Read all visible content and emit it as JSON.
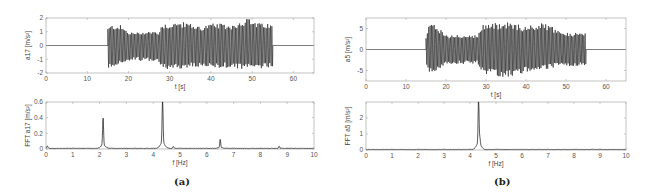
{
  "panels": [
    {
      "label": "(a)"
    },
    {
      "label": "(b)"
    }
  ],
  "chart_data": [
    {
      "type": "line",
      "panel": "(a)",
      "position": "top",
      "xlabel": "t [s]",
      "ylabel": "a17 [m/s²]",
      "xlim": [
        0,
        65
      ],
      "ylim": [
        -2,
        2
      ],
      "xticks": [
        0,
        10,
        20,
        30,
        40,
        50,
        60
      ],
      "yticks": [
        -2,
        -1,
        0,
        1,
        2
      ],
      "active_interval": [
        15,
        55
      ],
      "envelope": {
        "t": [
          15,
          16,
          18,
          20,
          22,
          24,
          26,
          27.5,
          28,
          30,
          32,
          34,
          36,
          38,
          40,
          42,
          44,
          46,
          48,
          49,
          50,
          52,
          54,
          55
        ],
        "upper": [
          1.3,
          1.5,
          1.5,
          1.0,
          0.95,
          1.05,
          1.05,
          1.0,
          1.6,
          1.6,
          1.7,
          1.7,
          1.5,
          1.4,
          1.6,
          1.6,
          1.5,
          1.6,
          1.9,
          2.0,
          1.8,
          1.6,
          1.6,
          1.5
        ],
        "lower": [
          -1.8,
          -1.6,
          -1.3,
          -1.2,
          -1.1,
          -1.15,
          -1.2,
          -1.2,
          -1.7,
          -1.75,
          -1.7,
          -1.7,
          -1.6,
          -1.6,
          -1.7,
          -1.7,
          -1.6,
          -1.7,
          -1.8,
          -1.75,
          -1.7,
          -1.7,
          -1.6,
          -1.6
        ]
      },
      "grid": false
    },
    {
      "type": "line",
      "panel": "(a)",
      "position": "bottom",
      "xlabel": "f [Hz]",
      "ylabel": "FFT a17 [m/s²]",
      "xlim": [
        0,
        10
      ],
      "ylim": [
        0,
        0.6
      ],
      "xticks": [
        0,
        1,
        2,
        3,
        4,
        5,
        6,
        7,
        8,
        9,
        10
      ],
      "yticks": [
        0,
        0.2,
        0.4,
        0.6
      ],
      "peaks": [
        {
          "f": 0.05,
          "amp": 0.03
        },
        {
          "f": 2.13,
          "amp": 0.35
        },
        {
          "f": 4.35,
          "amp": 0.59
        },
        {
          "f": 4.75,
          "amp": 0.02
        },
        {
          "f": 6.5,
          "amp": 0.1
        },
        {
          "f": 8.7,
          "amp": 0.025
        }
      ],
      "baseline": 0.008,
      "grid": false
    },
    {
      "type": "line",
      "panel": "(b)",
      "position": "top",
      "xlabel": "t [s]",
      "ylabel": "a5 [m/s²]",
      "xlim": [
        0,
        65
      ],
      "ylim": [
        -7.5,
        7.5
      ],
      "xticks": [
        0,
        10,
        20,
        30,
        40,
        50,
        60
      ],
      "yticks": [
        -5,
        0,
        5
      ],
      "active_interval": [
        15,
        55
      ],
      "envelope": {
        "t": [
          15,
          16,
          18,
          20,
          22,
          24,
          26,
          28,
          29,
          30,
          32,
          34,
          36,
          38,
          40,
          42,
          44,
          46,
          48,
          50,
          52,
          54,
          55
        ],
        "upper": [
          3.5,
          6.5,
          5.5,
          3.5,
          3.5,
          3.5,
          3.5,
          3.5,
          6.0,
          6.2,
          6.3,
          6.4,
          6.5,
          6.0,
          5.5,
          6.0,
          6.3,
          6.0,
          4.5,
          4.0,
          4.0,
          4.0,
          4.0
        ],
        "lower": [
          -3.5,
          -6.0,
          -5.0,
          -3.5,
          -3.5,
          -3.5,
          -3.5,
          -3.5,
          -5.5,
          -6.0,
          -6.2,
          -6.5,
          -6.5,
          -6.0,
          -5.5,
          -5.0,
          -5.0,
          -4.5,
          -4.0,
          -4.0,
          -4.0,
          -4.0,
          -4.0
        ]
      },
      "grid": false
    },
    {
      "type": "line",
      "panel": "(b)",
      "position": "bottom",
      "xlabel": "f [Hz]",
      "ylabel": "FFT a5 [m/s²]",
      "xlim": [
        0,
        10
      ],
      "ylim": [
        0,
        3
      ],
      "xticks": [
        0,
        1,
        2,
        3,
        4,
        5,
        6,
        7,
        8,
        9,
        10
      ],
      "yticks": [
        0,
        1,
        2
      ],
      "peaks": [
        {
          "f": 4.33,
          "amp": 2.95
        },
        {
          "f": 4.38,
          "amp": 0.4
        },
        {
          "f": 8.7,
          "amp": 0.02
        }
      ],
      "baseline": 0.03,
      "grid": false
    }
  ]
}
